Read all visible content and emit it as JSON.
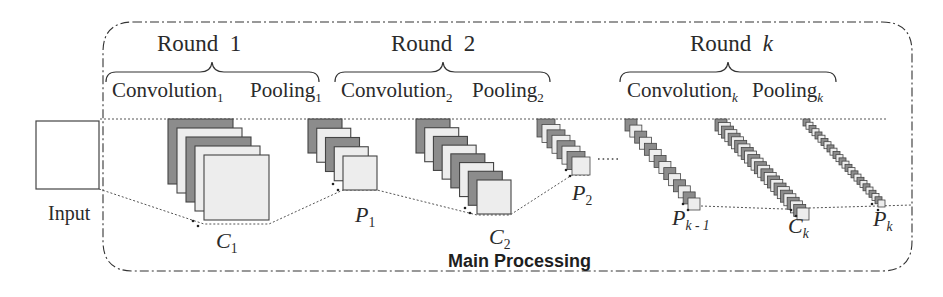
{
  "diagram": {
    "title": "Main Processing",
    "input_label": "Input",
    "rounds": [
      {
        "title": "Round",
        "index": "1",
        "index_italic": false,
        "convolution": {
          "label": "Convolution",
          "sub": "1"
        },
        "pooling": {
          "label": "Pooling",
          "sub": "1"
        }
      },
      {
        "title": "Round",
        "index": "2",
        "index_italic": false,
        "convolution": {
          "label": "Convolution",
          "sub": "2"
        },
        "pooling": {
          "label": "Pooling",
          "sub": "2"
        }
      },
      {
        "title": "Round",
        "index": "k",
        "index_italic": true,
        "convolution": {
          "label": "Convolution",
          "sub": "k"
        },
        "pooling": {
          "label": "Pooling",
          "sub": "k"
        }
      }
    ],
    "nodes": {
      "c1": {
        "letter": "C",
        "sub": "1"
      },
      "p1": {
        "letter": "P",
        "sub": "1"
      },
      "c2": {
        "letter": "C",
        "sub": "2"
      },
      "p2": {
        "letter": "P",
        "sub": "2"
      },
      "pk_1": {
        "letter": "P",
        "sub": "k - 1"
      },
      "ck": {
        "letter": "C",
        "sub": "k"
      },
      "pk": {
        "letter": "P",
        "sub": "k"
      }
    },
    "ellipsis": "......",
    "colors": {
      "dark_map": "#8c8c8c",
      "light_map": "#ededed",
      "stroke": "#444444",
      "border": "#333333"
    }
  }
}
